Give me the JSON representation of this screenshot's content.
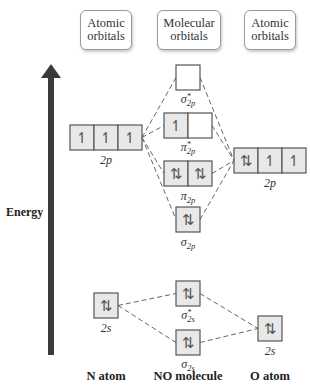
{
  "headers": {
    "left": {
      "line1": "Atomic",
      "line2": "orbitals"
    },
    "middle": {
      "line1": "Molecular",
      "line2": "orbitals"
    },
    "right": {
      "line1": "Atomic",
      "line2": "orbitals"
    }
  },
  "axis": {
    "label": "Energy"
  },
  "columns": {
    "n_atom": "N atom",
    "no_molecule": "NO molecule",
    "o_atom": "O atom"
  },
  "colors": {
    "filled_box": "#e8e8e8",
    "empty_box": "#ffffff",
    "box_border": "#555555",
    "arrow": "#3a3a3a",
    "dash_line": "#666666"
  },
  "orbitals": [
    {
      "id": "n_2p",
      "label": "2p",
      "base": "2p",
      "sub": "",
      "star": false,
      "x": 70,
      "y": 125,
      "cells": [
        "↿",
        "↿",
        "↿"
      ],
      "label_y": 153
    },
    {
      "id": "o_2p",
      "label": "2p",
      "base": "2p",
      "sub": "",
      "star": false,
      "x": 234,
      "y": 148,
      "cells": [
        "⇅",
        "↿",
        "↿"
      ],
      "label_y": 176
    },
    {
      "id": "sigma_star_2p",
      "label": "σ*2p",
      "base": "σ",
      "sub": "2p",
      "star": true,
      "x": 176,
      "y": 65,
      "cells": [
        ""
      ],
      "label_y": 92
    },
    {
      "id": "pi_star_2p",
      "label": "π*2p",
      "base": "π",
      "sub": "2p",
      "star": true,
      "x": 164,
      "y": 113,
      "cells": [
        "↿",
        ""
      ],
      "label_y": 140
    },
    {
      "id": "pi_2p",
      "label": "π2p",
      "base": "π",
      "sub": "2p",
      "star": false,
      "x": 164,
      "y": 161,
      "cells": [
        "⇅",
        "⇅"
      ],
      "label_y": 189
    },
    {
      "id": "sigma_2p",
      "label": "σ2p",
      "base": "σ",
      "sub": "2p",
      "star": false,
      "x": 176,
      "y": 207,
      "cells": [
        "⇅"
      ],
      "label_y": 235
    },
    {
      "id": "n_2s",
      "label": "2s",
      "base": "2s",
      "sub": "",
      "star": false,
      "x": 94,
      "y": 293,
      "cells": [
        "⇅"
      ],
      "label_y": 321
    },
    {
      "id": "sigma_star_2s",
      "label": "σ*2s",
      "base": "σ",
      "sub": "2s",
      "star": true,
      "x": 176,
      "y": 281,
      "cells": [
        "⇅"
      ],
      "label_y": 308
    },
    {
      "id": "sigma_2s",
      "label": "σ2s",
      "base": "σ",
      "sub": "2s",
      "star": false,
      "x": 176,
      "y": 330,
      "cells": [
        "⇅"
      ],
      "label_y": 357
    },
    {
      "id": "o_2s",
      "label": "2s",
      "base": "2s",
      "sub": "",
      "star": false,
      "x": 258,
      "y": 316,
      "cells": [
        "⇅"
      ],
      "label_y": 344
    }
  ]
}
